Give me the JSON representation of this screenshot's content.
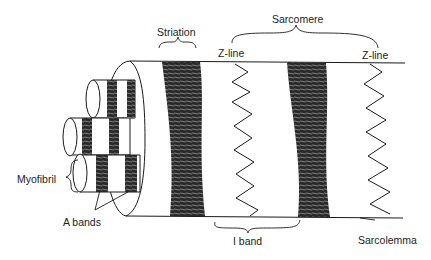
{
  "labels": {
    "striation": "Striation",
    "sarcomere": "Sarcomere",
    "zline_left": "Z-line",
    "zline_right": "Z-line",
    "myofibril": "Myofibril",
    "a_bands": "A bands",
    "i_band": "I band",
    "sarcolemma": "Sarcolemma"
  },
  "colors": {
    "ink": "#1a1a1a",
    "background": "#ffffff"
  }
}
